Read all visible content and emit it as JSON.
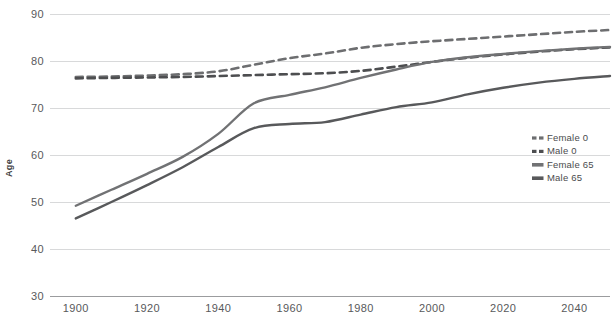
{
  "chart_data": {
    "type": "line",
    "title": "",
    "xlabel": "",
    "ylabel": "Age",
    "xlim": [
      1895,
      2050
    ],
    "ylim": [
      30,
      90
    ],
    "grid": true,
    "legend_position": "right",
    "xticks": [
      "1900",
      "1920",
      "1940",
      "1960",
      "1980",
      "2000",
      "2020",
      "2040"
    ],
    "xtick_values": [
      1900,
      1920,
      1940,
      1960,
      1980,
      2000,
      2020,
      2040
    ],
    "yticks": [
      "30",
      "40",
      "50",
      "60",
      "70",
      "80",
      "90"
    ],
    "ytick_values": [
      30,
      40,
      50,
      60,
      70,
      80,
      90
    ],
    "x": [
      1900,
      1910,
      1920,
      1930,
      1940,
      1950,
      1960,
      1970,
      1980,
      1990,
      2000,
      2010,
      2020,
      2030,
      2040,
      2050
    ],
    "series": [
      {
        "name": "Female 0",
        "style": "dashed",
        "color": "#6d6e70",
        "values": [
          76.6,
          76.7,
          76.9,
          77.2,
          77.8,
          79.2,
          80.6,
          81.6,
          82.8,
          83.6,
          84.2,
          84.7,
          85.2,
          85.7,
          86.2,
          86.6
        ]
      },
      {
        "name": "Male 0",
        "style": "dashed",
        "color": "#4d4e50",
        "values": [
          76.3,
          76.4,
          76.5,
          76.6,
          76.8,
          77.0,
          77.2,
          77.4,
          77.9,
          78.8,
          79.8,
          80.7,
          81.4,
          82.0,
          82.5,
          82.9
        ]
      },
      {
        "name": "Female 65",
        "style": "solid",
        "color": "#717274",
        "values": [
          49.2,
          52.6,
          56.0,
          59.6,
          64.5,
          71.0,
          72.8,
          74.4,
          76.4,
          78.2,
          79.8,
          80.8,
          81.5,
          82.1,
          82.6,
          83.0
        ]
      },
      {
        "name": "Male 65",
        "style": "solid",
        "color": "#58595b",
        "values": [
          46.5,
          50.0,
          53.6,
          57.4,
          61.7,
          65.7,
          66.6,
          67.0,
          68.6,
          70.2,
          71.2,
          72.9,
          74.3,
          75.4,
          76.2,
          76.8
        ]
      }
    ],
    "legend": [
      {
        "label": "Female 0",
        "style": "dashed",
        "color": "#6d6e70"
      },
      {
        "label": "Male 0",
        "style": "dashed",
        "color": "#4d4e50"
      },
      {
        "label": "Female 65",
        "style": "solid",
        "color": "#717274"
      },
      {
        "label": "Male 65",
        "style": "solid",
        "color": "#58595b"
      }
    ]
  }
}
